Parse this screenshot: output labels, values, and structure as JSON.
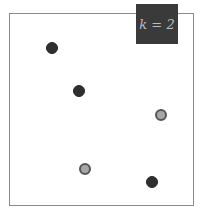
{
  "label": {
    "text": "k = 2",
    "bg": "#3a3a3a",
    "fg": "#bdbdbd"
  },
  "points": [
    {
      "x": 52,
      "y": 48,
      "cls": "dark"
    },
    {
      "x": 79,
      "y": 91,
      "cls": "dark"
    },
    {
      "x": 161,
      "y": 115,
      "cls": "grey"
    },
    {
      "x": 85,
      "y": 169,
      "cls": "grey"
    },
    {
      "x": 152,
      "y": 182,
      "cls": "dark"
    }
  ]
}
